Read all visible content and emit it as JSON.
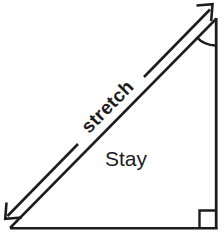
{
  "diagram": {
    "background_color": "#ffffff",
    "ink_color": "#1d1d1d",
    "labels": {
      "stretch": "stretch",
      "stay": "Stay"
    },
    "markers": {
      "right_angle": "right-angle-square",
      "apex_angle": "angle-arc"
    },
    "shapes": {
      "triangle_name": "right-triangle",
      "arrow_name": "double-headed-stretch-arrow"
    },
    "geometry": {
      "canvas_width": 224,
      "canvas_height": 235,
      "triangle_vertices": [
        [
          10,
          228
        ],
        [
          217,
          228
        ],
        [
          217,
          18
        ]
      ],
      "arrow_start": [
        5,
        218
      ],
      "arrow_end": [
        212,
        5
      ],
      "stretch_rotation_deg": -45.4,
      "stay_position": [
        105,
        166
      ]
    }
  }
}
